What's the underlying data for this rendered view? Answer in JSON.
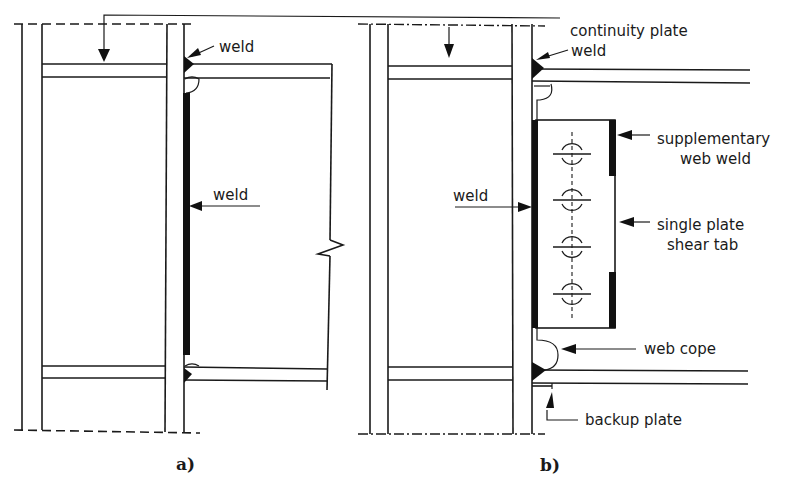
{
  "diagram": {
    "type": "structural steel beam-to-column moment connection details",
    "panel_a": {
      "caption": "a)",
      "labels": {
        "top_weld": "weld",
        "web_weld": "weld"
      }
    },
    "panel_b": {
      "caption": "b)",
      "labels": {
        "continuity_plate": "continuity plate",
        "top_weld": "weld",
        "web_weld": "weld",
        "supplementary_line1": "supplementary",
        "supplementary_line2": "web weld",
        "shear_tab_line1": "single plate",
        "shear_tab_line2": "shear tab",
        "web_cope": "web cope",
        "backup_plate": "backup plate"
      },
      "bolt_count": 4
    },
    "colors": {
      "ink": "#1a1a1a",
      "background": "#ffffff"
    }
  }
}
